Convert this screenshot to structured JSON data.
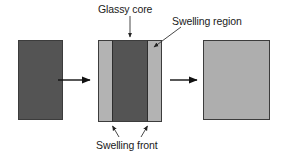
{
  "diagram": {
    "background_color": "#ffffff",
    "labels": {
      "glassy_core": "Glassy core",
      "swelling_region": "Swelling region",
      "swelling_front": "Swelling front"
    },
    "colors": {
      "glassy": "#545454",
      "swollen": "#b3b3b3",
      "swollen_right": "#aeaeae",
      "outline": "#3c3c3c",
      "divider": "#2e2e2e",
      "arrow": "#111111",
      "leader": "#333333",
      "text": "#1a1a1a"
    },
    "stages": [
      {
        "name": "stage-1-dry-tablet",
        "x": 18,
        "y": 40,
        "width": 45,
        "height": 80,
        "regions": [
          {
            "name": "glassy-core",
            "fill": "#545454",
            "x": 0,
            "width": 45
          }
        ]
      },
      {
        "name": "stage-2-partially-swollen",
        "x": 98,
        "y": 40,
        "width": 64,
        "height": 82,
        "regions": [
          {
            "name": "swelling-region-left",
            "fill": "#b3b3b3",
            "x": 0,
            "width": 14
          },
          {
            "name": "glassy-core",
            "fill": "#545454",
            "x": 14,
            "width": 35
          },
          {
            "name": "swelling-region-right",
            "fill": "#b3b3b3",
            "x": 49,
            "width": 15
          }
        ],
        "fronts": [
          {
            "name": "swelling-front-left",
            "x": 112
          },
          {
            "name": "swelling-front-right",
            "x": 147
          }
        ]
      },
      {
        "name": "stage-3-fully-swollen",
        "x": 203,
        "y": 40,
        "width": 67,
        "height": 80,
        "regions": [
          {
            "name": "swelling-region",
            "fill": "#aeaeae",
            "x": 0,
            "width": 67
          }
        ]
      }
    ],
    "transition_arrows": [
      {
        "name": "transition-arrow-1",
        "x1": 58,
        "y1": 80,
        "x2": 92,
        "y2": 80
      },
      {
        "name": "transition-arrow-2",
        "x1": 170,
        "y1": 80,
        "x2": 199,
        "y2": 80
      }
    ],
    "leader_lines": [
      {
        "name": "glassy-core-leader",
        "x1": 130,
        "y1": 16,
        "x2": 130,
        "y2": 39
      },
      {
        "name": "swelling-region-leader",
        "x1": 180,
        "y1": 27,
        "x2": 153,
        "y2": 48
      },
      {
        "name": "swelling-front-leader-left",
        "x1": 119,
        "y1": 137,
        "x2": 112,
        "y2": 124
      },
      {
        "name": "swelling-front-leader-right",
        "x1": 140,
        "y1": 137,
        "x2": 147,
        "y2": 124
      }
    ]
  }
}
